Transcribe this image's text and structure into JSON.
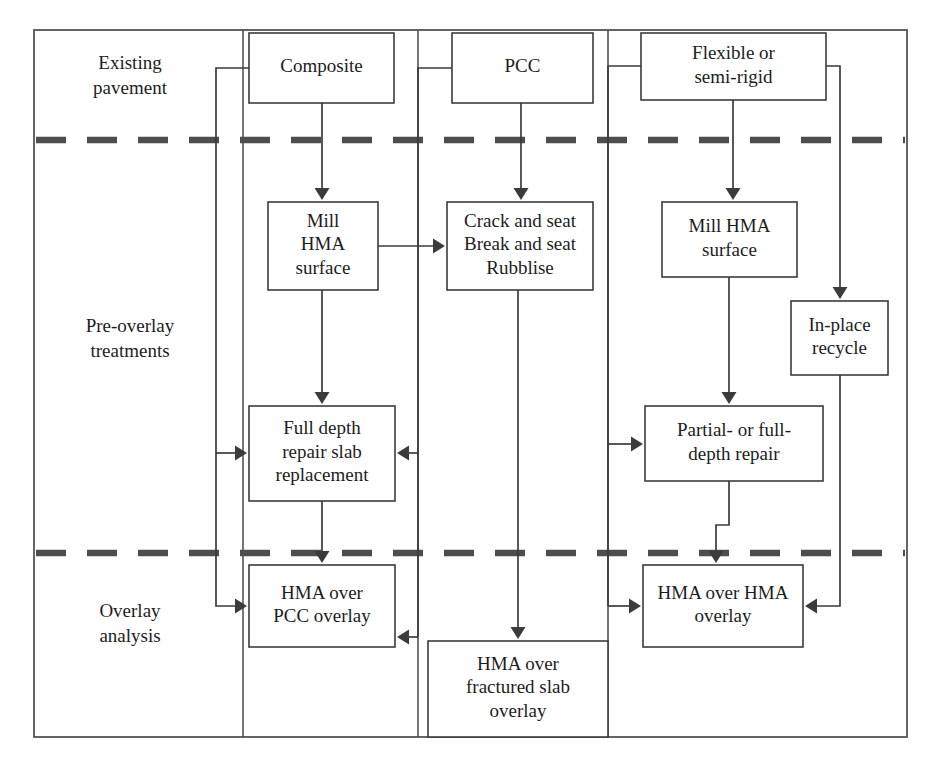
{
  "diagram": {
    "frame": {
      "x": 34,
      "y": 30,
      "w": 873,
      "h": 707
    },
    "colors": {
      "line": "#3b3b3b",
      "frame": "#4a4a4a",
      "dashed": "#4d4d4d",
      "box_fill": "#ffffff",
      "text": "#1d1d1d"
    },
    "stage_labels": [
      {
        "id": "existing-pavement",
        "lines": [
          "Existing",
          "pavement"
        ],
        "x": 130,
        "y": 77
      },
      {
        "id": "pre-overlay-treatments",
        "lines": [
          "Pre-overlay",
          "treatments"
        ],
        "x": 130,
        "y": 340
      },
      {
        "id": "overlay-analysis",
        "lines": [
          "Overlay",
          "analysis"
        ],
        "x": 130,
        "y": 625
      }
    ],
    "dashed_separators": [
      {
        "id": "sep-existing-preoverlay",
        "y": 140
      },
      {
        "id": "sep-preoverlay-analysis",
        "y": 553
      }
    ],
    "column_dividers": [
      {
        "id": "divider-composite-pcc",
        "x": 418
      },
      {
        "id": "divider-pcc-flexible",
        "x": 608
      }
    ],
    "boxes": [
      {
        "id": "composite",
        "lines": [
          "Composite"
        ],
        "x": 249,
        "y": 33,
        "w": 145,
        "h": 70
      },
      {
        "id": "pcc",
        "lines": [
          "PCC"
        ],
        "x": 452,
        "y": 33,
        "w": 141,
        "h": 70
      },
      {
        "id": "flexible-or-semi-rigid",
        "lines": [
          "Flexible or",
          "semi-rigid"
        ],
        "x": 641,
        "y": 33,
        "w": 185,
        "h": 67
      },
      {
        "id": "mill-hma-surface-composite",
        "lines": [
          "Mill",
          "HMA",
          "surface"
        ],
        "x": 268,
        "y": 202,
        "w": 110,
        "h": 88
      },
      {
        "id": "crack-break-rubblise",
        "lines": [
          "Crack and seat",
          "Break and seat",
          "Rubblise"
        ],
        "x": 447,
        "y": 202,
        "w": 146,
        "h": 88
      },
      {
        "id": "mill-hma-surface-flexible",
        "lines": [
          "Mill HMA",
          "surface"
        ],
        "x": 662,
        "y": 202,
        "w": 135,
        "h": 75
      },
      {
        "id": "in-place-recycle",
        "lines": [
          "In-place",
          "recycle"
        ],
        "x": 791,
        "y": 301,
        "w": 97,
        "h": 74
      },
      {
        "id": "full-depth-repair-slab-replacement",
        "lines": [
          "Full depth",
          "repair slab",
          "replacement"
        ],
        "x": 249,
        "y": 406,
        "w": 146,
        "h": 95
      },
      {
        "id": "partial-or-full-depth-repair",
        "lines": [
          "Partial- or full-",
          "depth repair"
        ],
        "x": 645,
        "y": 406,
        "w": 178,
        "h": 75
      },
      {
        "id": "hma-over-pcc-overlay",
        "lines": [
          "HMA over",
          "PCC overlay"
        ],
        "x": 249,
        "y": 565,
        "w": 146,
        "h": 82
      },
      {
        "id": "hma-over-hma-overlay",
        "lines": [
          "HMA over HMA",
          "overlay"
        ],
        "x": 643,
        "y": 565,
        "w": 160,
        "h": 82
      },
      {
        "id": "hma-over-fractured-slab-overlay",
        "lines": [
          "HMA over",
          "fractured slab",
          "overlay"
        ],
        "x": 428,
        "y": 641,
        "w": 180,
        "h": 96
      }
    ],
    "connectors": [
      {
        "id": "composite-to-mill",
        "points": "322,103 322,198",
        "arrow": "down",
        "tip": [
          322,
          200
        ]
      },
      {
        "id": "composite-left-to-fulldepth",
        "points": "249,68 216,68 216,453",
        "arrow": "none"
      },
      {
        "id": "composite-branch-fulldepth",
        "points": "216,453 243,453",
        "arrow": "right",
        "tip": [
          247,
          453
        ]
      },
      {
        "id": "composite-branch-hmapcc",
        "points": "216,453 216,606 243,606",
        "arrow": "right",
        "tip": [
          247,
          606
        ]
      },
      {
        "id": "mill-to-crackseat",
        "points": "378,246 441,246",
        "arrow": "right",
        "tip": [
          445,
          246
        ]
      },
      {
        "id": "mill-to-fulldepth",
        "points": "322,290 322,402",
        "arrow": "down",
        "tip": [
          322,
          404
        ]
      },
      {
        "id": "fulldepth-to-hmapcc",
        "points": "322,501 322,561",
        "arrow": "down",
        "tip": [
          322,
          563
        ]
      },
      {
        "id": "pcc-to-crackseat",
        "points": "521,103 521,198",
        "arrow": "down",
        "tip": [
          521,
          200
        ]
      },
      {
        "id": "pcc-left-down",
        "points": "452,68 418,68 418,637",
        "arrow": "none"
      },
      {
        "id": "pcc-branch-fulldepth",
        "points": "418,453 401,453",
        "arrow": "left",
        "tip": [
          397,
          453
        ]
      },
      {
        "id": "pcc-branch-hmapcc",
        "points": "418,637 401,637",
        "arrow": "left",
        "tip": [
          397,
          637
        ]
      },
      {
        "id": "crackseat-to-fracturedslab",
        "points": "518,290 518,636",
        "arrow": "down",
        "tip": [
          518,
          639
        ]
      },
      {
        "id": "flexible-to-mill",
        "points": "733,100 733,198",
        "arrow": "down",
        "tip": [
          733,
          200
        ]
      },
      {
        "id": "flexible-left-down",
        "points": "641,66 608,66 608,606",
        "arrow": "none"
      },
      {
        "id": "flexible-branch-partialrepair",
        "points": "608,444 639,444",
        "arrow": "right",
        "tip": [
          643,
          444
        ]
      },
      {
        "id": "flexible-branch-hmahma",
        "points": "608,606 637,606",
        "arrow": "right",
        "tip": [
          641,
          606
        ]
      },
      {
        "id": "flexible-right-to-recycle",
        "points": "826,66 840,66 840,297",
        "arrow": "down",
        "tip": [
          840,
          299
        ]
      },
      {
        "id": "mill-flexible-to-partialrepair",
        "points": "729,277 729,402",
        "arrow": "down",
        "tip": [
          729,
          404
        ]
      },
      {
        "id": "partialrepair-to-hmahma",
        "points": "729,481 729,525 716,525 716,561",
        "arrow": "down",
        "tip": [
          716,
          563
        ]
      },
      {
        "id": "recycle-to-hmahma",
        "points": "840,375 840,606 809,606",
        "arrow": "left",
        "tip": [
          805,
          606
        ]
      }
    ]
  }
}
